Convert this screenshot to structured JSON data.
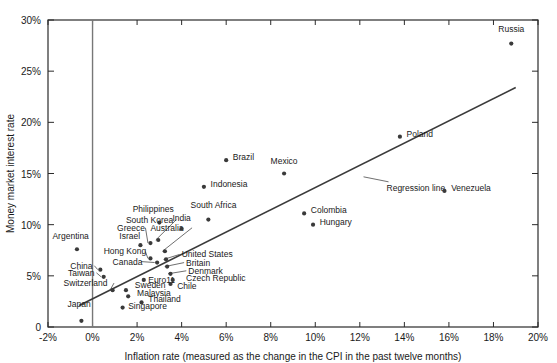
{
  "chart_data": {
    "type": "scatter",
    "title": "",
    "xlabel": "Inflation rate (measured as the change in the CPI in the past twelve months)",
    "ylabel": "Money market interest rate",
    "xlim": [
      -2,
      20
    ],
    "ylim": [
      0,
      30
    ],
    "xticks": [
      "-2%",
      "0%",
      "2%",
      "4%",
      "6%",
      "8%",
      "10%",
      "12%",
      "14%",
      "16%",
      "18%",
      "20%"
    ],
    "xtick_values": [
      -2,
      0,
      2,
      4,
      6,
      8,
      10,
      12,
      14,
      16,
      18,
      20
    ],
    "yticks": [
      "0",
      "5%",
      "10%",
      "15%",
      "20%",
      "25%",
      "30%"
    ],
    "ytick_values": [
      0,
      5,
      10,
      15,
      20,
      25,
      30
    ],
    "grid": false,
    "legend": false,
    "annotations": [
      {
        "text": "Regression line",
        "x": 13.2,
        "y": 13.6
      }
    ],
    "regression_line": {
      "x1": -0.6,
      "y1": 2.1,
      "x2": 19.0,
      "y2": 23.4
    },
    "points": [
      {
        "label": "Japan",
        "x": -0.5,
        "y": 0.6,
        "lx": -0.6,
        "ly": 2.0,
        "anchor": "middle"
      },
      {
        "label": "Argentina",
        "x": -0.7,
        "y": 7.6,
        "lx": -1.8,
        "ly": 8.6,
        "anchor": "start"
      },
      {
        "label": "China",
        "x": 0.35,
        "y": 5.6,
        "lx": -1.0,
        "ly": 5.7,
        "anchor": "start",
        "leader": true
      },
      {
        "label": "Taiwan",
        "x": 0.5,
        "y": 4.9,
        "lx": -1.1,
        "ly": 5.0,
        "anchor": "start",
        "leader": true
      },
      {
        "label": "Switzerland",
        "x": 0.9,
        "y": 3.6,
        "lx": -1.3,
        "ly": 4.0,
        "anchor": "start",
        "leader": true
      },
      {
        "label": "Hong Kong",
        "x": 2.6,
        "y": 6.7,
        "lx": 0.5,
        "ly": 7.1,
        "anchor": "start",
        "leader": true
      },
      {
        "label": "Canada",
        "x": 2.9,
        "y": 6.3,
        "lx": 0.9,
        "ly": 6.1,
        "anchor": "start",
        "leader": true
      },
      {
        "label": "Israel",
        "x": 2.15,
        "y": 8.0,
        "lx": 1.2,
        "ly": 8.6,
        "anchor": "start"
      },
      {
        "label": "Greece",
        "x": 2.6,
        "y": 8.2,
        "lx": 1.1,
        "ly": 9.4,
        "anchor": "start",
        "leader": true
      },
      {
        "label": "South Korea",
        "x": 2.95,
        "y": 8.5,
        "lx": 1.5,
        "ly": 10.2,
        "anchor": "start",
        "leader": true
      },
      {
        "label": "Australia",
        "x": 3.25,
        "y": 7.4,
        "lx": 2.6,
        "ly": 9.4,
        "anchor": "start",
        "leader": true
      },
      {
        "label": "United States",
        "x": 3.3,
        "y": 6.6,
        "lx": 4.0,
        "ly": 6.8,
        "anchor": "start",
        "leader": true
      },
      {
        "label": "Britain",
        "x": 3.35,
        "y": 5.9,
        "lx": 4.2,
        "ly": 6.0,
        "anchor": "start",
        "leader": true
      },
      {
        "label": "Denmark",
        "x": 3.5,
        "y": 5.2,
        "lx": 4.3,
        "ly": 5.2,
        "anchor": "start",
        "leader": true
      },
      {
        "label": "Euro11",
        "x": 2.3,
        "y": 4.6,
        "lx": 2.5,
        "ly": 4.3,
        "anchor": "start"
      },
      {
        "label": "Czech Republic",
        "x": 3.6,
        "y": 4.6,
        "lx": 4.2,
        "ly": 4.5,
        "anchor": "start"
      },
      {
        "label": "Chile",
        "x": 3.5,
        "y": 4.2,
        "lx": 3.8,
        "ly": 3.7,
        "anchor": "start"
      },
      {
        "label": "Sweden",
        "x": 1.5,
        "y": 3.6,
        "lx": 1.9,
        "ly": 3.8,
        "anchor": "start"
      },
      {
        "label": "Malaysia",
        "x": 1.6,
        "y": 3.0,
        "lx": 2.0,
        "ly": 3.0,
        "anchor": "start"
      },
      {
        "label": "Thailand",
        "x": 2.2,
        "y": 2.4,
        "lx": 2.5,
        "ly": 2.4,
        "anchor": "start"
      },
      {
        "label": "Singapore",
        "x": 1.35,
        "y": 1.9,
        "lx": 1.6,
        "ly": 1.8,
        "anchor": "start"
      },
      {
        "label": "Philippines",
        "x": 3.0,
        "y": 10.2,
        "lx": 1.8,
        "ly": 11.2,
        "anchor": "start"
      },
      {
        "label": "India",
        "x": 4.0,
        "y": 9.6,
        "lx": 4.0,
        "ly": 10.4,
        "anchor": "middle"
      },
      {
        "label": "South Africa",
        "x": 5.2,
        "y": 10.5,
        "lx": 4.4,
        "ly": 11.6,
        "anchor": "start"
      },
      {
        "label": "Indonesia",
        "x": 5.0,
        "y": 13.7,
        "lx": 5.3,
        "ly": 13.7,
        "anchor": "start"
      },
      {
        "label": "Brazil",
        "x": 6.0,
        "y": 16.3,
        "lx": 6.3,
        "ly": 16.3,
        "anchor": "start"
      },
      {
        "label": "Mexico",
        "x": 8.6,
        "y": 15.0,
        "lx": 8.6,
        "ly": 15.9,
        "anchor": "middle"
      },
      {
        "label": "Colombia",
        "x": 9.5,
        "y": 11.1,
        "lx": 9.8,
        "ly": 11.1,
        "anchor": "start"
      },
      {
        "label": "Hungary",
        "x": 9.9,
        "y": 10.0,
        "lx": 10.2,
        "ly": 10.0,
        "anchor": "start"
      },
      {
        "label": "Poland",
        "x": 13.8,
        "y": 18.6,
        "lx": 14.1,
        "ly": 18.6,
        "anchor": "start"
      },
      {
        "label": "Venezuela",
        "x": 15.8,
        "y": 13.3,
        "lx": 16.1,
        "ly": 13.3,
        "anchor": "start"
      },
      {
        "label": "Russia",
        "x": 18.8,
        "y": 27.7,
        "lx": 18.8,
        "ly": 28.8,
        "anchor": "middle"
      }
    ]
  }
}
